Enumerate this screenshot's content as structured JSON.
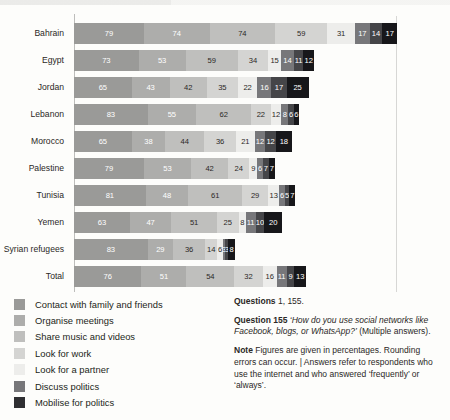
{
  "chart_data": {
    "type": "bar",
    "orientation": "horizontal",
    "stacked": true,
    "title": "",
    "subtitle": "",
    "xlabel": "",
    "ylabel": "",
    "grid": false,
    "legend_position": "bottom-left",
    "unit": "percent",
    "xlim": [
      0,
      350
    ],
    "categories": [
      "Bahrain",
      "Egypt",
      "Jordan",
      "Lebanon",
      "Morocco",
      "Palestine",
      "Tunisia",
      "Yemen",
      "Syrian refugees",
      "Total"
    ],
    "series": [
      {
        "name": "Contact with family and friends",
        "color": "#9a9a98",
        "label_color": "#ffffff",
        "values": [
          79,
          73,
          65,
          83,
          65,
          79,
          81,
          63,
          83,
          76
        ]
      },
      {
        "name": "Organise meetings",
        "color": "#adadab",
        "label_color": "#ffffff",
        "values": [
          74,
          53,
          43,
          55,
          38,
          53,
          48,
          47,
          29,
          51
        ]
      },
      {
        "name": "Share music and videos",
        "color": "#bfbfbd",
        "label_color": "#2b2826",
        "values": [
          74,
          59,
          42,
          62,
          44,
          42,
          61,
          51,
          36,
          54
        ]
      },
      {
        "name": "Look for work",
        "color": "#d4d4d2",
        "label_color": "#2b2826",
        "values": [
          59,
          34,
          35,
          22,
          36,
          24,
          29,
          25,
          14,
          32
        ]
      },
      {
        "name": "Look for a partner",
        "color": "#ededeb",
        "label_color": "#2b2826",
        "values": [
          31,
          15,
          22,
          12,
          21,
          9,
          13,
          8,
          6,
          16
        ]
      },
      {
        "name": "Discuss politics",
        "color": "#77777a",
        "label_color": "#ffffff",
        "values": [
          17,
          14,
          16,
          8,
          12,
          6,
          6,
          11,
          3,
          11
        ]
      },
      {
        "name": "Mobilise for politics",
        "color": "#454548",
        "label_color": "#ffffff",
        "values": [
          14,
          11,
          17,
          6,
          12,
          7,
          5,
          10,
          3,
          9
        ]
      },
      {
        "name": "",
        "color": "#17171a",
        "label_color": "#ffffff",
        "values": [
          17,
          12,
          25,
          6,
          18,
          7,
          7,
          20,
          8,
          13
        ]
      }
    ]
  },
  "legend": {
    "items": [
      {
        "label": "Contact with family and friends",
        "color": "#9a9a98"
      },
      {
        "label": "Organise meetings",
        "color": "#adadab"
      },
      {
        "label": "Share music and videos",
        "color": "#bfbfbd"
      },
      {
        "label": "Look for work",
        "color": "#d4d4d2"
      },
      {
        "label": "Look for a partner",
        "color": "#ededeb"
      },
      {
        "label": "Discuss politics",
        "color": "#77777a"
      },
      {
        "label": "Mobilise for politics",
        "color": "#2f2f32"
      }
    ]
  },
  "notes": {
    "questions_label": "Questions",
    "questions_value": "1, 155.",
    "question_label": "Question 155",
    "question_text": "‘How do you use social networks like Facebook, blogs, or WhatsApp?’",
    "question_suffix": " (Multiple answers).",
    "note_label": "Note",
    "note_text": " Figures are given in percentages. Rounding errors can occur. | Answers refer to respondents who use the internet and who answered ‘frequently’ or ‘always’."
  }
}
